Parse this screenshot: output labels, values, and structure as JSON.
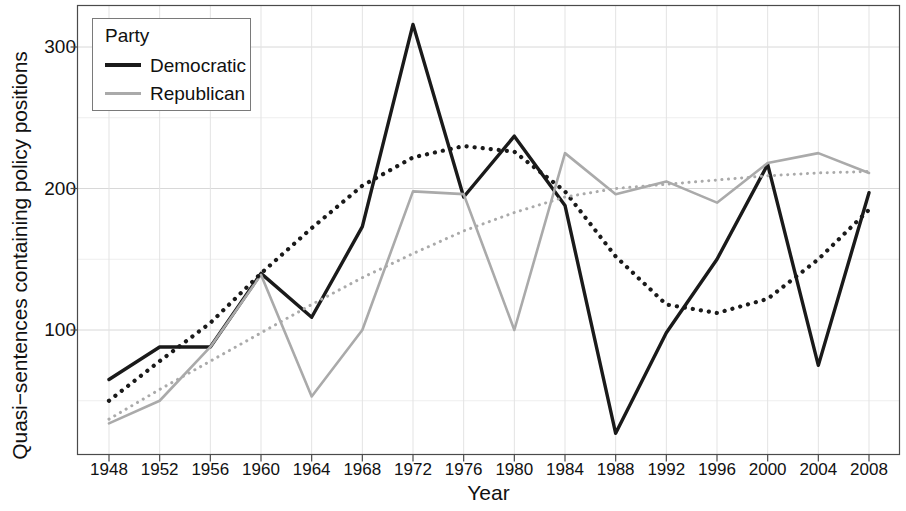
{
  "chart_data": {
    "type": "line",
    "title": "",
    "xlabel": "Year",
    "ylabel": "Quasi−sentences containing policy positions",
    "x": [
      1948,
      1952,
      1956,
      1960,
      1964,
      1968,
      1972,
      1976,
      1980,
      1984,
      1988,
      1992,
      1996,
      2000,
      2004,
      2008
    ],
    "xtick_labels": [
      "1948",
      "1952",
      "1956",
      "1960",
      "1964",
      "1968",
      "1972",
      "1976",
      "1980",
      "1984",
      "1988",
      "1992",
      "1996",
      "2000",
      "2004",
      "2008"
    ],
    "ytick_labels": [
      "100",
      "200",
      "300"
    ],
    "yticks": [
      100,
      200,
      300
    ],
    "xlim": [
      1946,
      2010
    ],
    "ylim": [
      15,
      325
    ],
    "grid": true,
    "legend_position": "top-left",
    "legend_title": "Party",
    "series": [
      {
        "name": "Democratic",
        "color": "#1a1a1a",
        "style": "solid",
        "values": [
          65,
          88,
          88,
          140,
          109,
          173,
          316,
          194,
          237,
          188,
          27,
          98,
          150,
          217,
          75,
          197
        ]
      },
      {
        "name": "Republican",
        "color": "#aaaaaa",
        "style": "solid",
        "values": [
          34,
          50,
          88,
          139,
          53,
          100,
          198,
          196,
          100,
          225,
          196,
          205,
          190,
          218,
          225,
          211
        ]
      },
      {
        "name": "Democratic trend",
        "color": "#1a1a1a",
        "style": "dotted",
        "values": [
          50,
          78,
          105,
          140,
          172,
          202,
          222,
          230,
          226,
          198,
          152,
          118,
          112,
          122,
          150,
          185
        ]
      },
      {
        "name": "Republican trend",
        "color": "#aaaaaa",
        "style": "dotted",
        "values": [
          37,
          58,
          78,
          98,
          118,
          137,
          154,
          170,
          183,
          194,
          200,
          203,
          206,
          209,
          211,
          212
        ]
      }
    ]
  },
  "legend": {
    "title": "Party",
    "entries": [
      {
        "label": "Democratic",
        "color": "#1a1a1a"
      },
      {
        "label": "Republican",
        "color": "#aaaaaa"
      }
    ]
  },
  "axes": {
    "x_title": "Year",
    "y_title": "Quasi−sentences containing policy positions"
  }
}
